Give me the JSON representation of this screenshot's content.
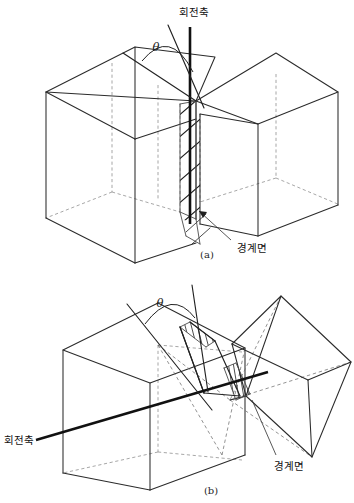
{
  "document": {
    "type": "technical-line-diagram",
    "background_color": "#ffffff",
    "ink_color": "#1f1f1f",
    "hidden_line_color": "#8a8a8a",
    "width": 354,
    "height": 503
  },
  "figures": [
    {
      "id": "a",
      "caption": "(a)",
      "caption_x": 207,
      "caption_y": 255,
      "description": "Two rectangular blocks meeting at a hatched boundary plane, with a vertical rotation axis",
      "labels": {
        "rotation_axis": "회전축",
        "rotation_axis_x": 194,
        "rotation_axis_y": 13,
        "boundary_plane": "경계면",
        "boundary_plane_x": 252,
        "boundary_plane_y": 249,
        "angle_symbol": "θ",
        "angle_symbol_x": 156,
        "angle_symbol_y": 48
      }
    },
    {
      "id": "b",
      "caption": "(b)",
      "caption_x": 211,
      "caption_y": 491,
      "description": "Rectangular block joined to a wedge-shaped polyhedron across hatched boundary planes, with an inclined rotation axis",
      "labels": {
        "rotation_axis": "회전축",
        "rotation_axis_x": 4,
        "rotation_axis_y": 440,
        "boundary_plane": "경계면",
        "boundary_plane_x": 272,
        "boundary_plane_y": 467,
        "angle_symbol": "θ",
        "angle_symbol_x": 160,
        "angle_symbol_y": 304
      }
    }
  ],
  "glossary": {
    "rotation_axis_ko": "회전축",
    "rotation_axis_meaning": "rotation axis",
    "boundary_plane_ko": "경계면",
    "boundary_plane_meaning": "boundary plane",
    "angle": "θ"
  }
}
